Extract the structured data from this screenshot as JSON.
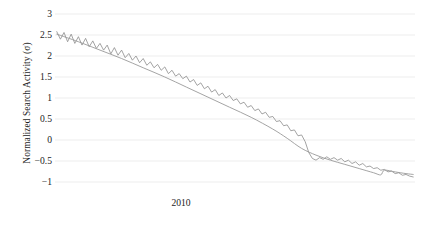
{
  "chart_data": {
    "type": "line",
    "title": "",
    "subtitle": "",
    "xlabel": "",
    "ylabel": "Normalized Search Activity (σ)",
    "ylim": [
      -1,
      3
    ],
    "yticks": [
      3,
      2.5,
      2,
      1.5,
      1,
      0.5,
      0,
      -0.5,
      -1
    ],
    "ytick_labels": [
      "3",
      "2.5",
      "2",
      "1.5",
      "1",
      "0.5",
      "0",
      "−0.5",
      "−1"
    ],
    "xticks": [
      2010
    ],
    "xtick_labels": [
      "2010"
    ],
    "xlim": [
      2008.6,
      2012.6
    ],
    "grid": "horizontal",
    "legend": "none",
    "annotations": [],
    "colors": {
      "noisy_series": "#8c8c8c",
      "smooth_series": "#9a9a9a",
      "gridline": "#e8e8e8",
      "text": "#1d1d1d",
      "background": "#ffffff"
    },
    "series": [
      {
        "name": "Observed normalized search activity",
        "style": "noisy",
        "x": [
          2008.62,
          2008.66,
          2008.7,
          2008.74,
          2008.78,
          2008.82,
          2008.86,
          2008.9,
          2008.94,
          2008.98,
          2009.02,
          2009.06,
          2009.1,
          2009.14,
          2009.18,
          2009.22,
          2009.26,
          2009.3,
          2009.34,
          2009.38,
          2009.42,
          2009.46,
          2009.5,
          2009.54,
          2009.58,
          2009.62,
          2009.66,
          2009.7,
          2009.74,
          2009.78,
          2009.82,
          2009.86,
          2009.9,
          2009.94,
          2009.98,
          2010.02,
          2010.06,
          2010.1,
          2010.14,
          2010.18,
          2010.22,
          2010.26,
          2010.3,
          2010.34,
          2010.38,
          2010.42,
          2010.46,
          2010.5,
          2010.54,
          2010.58,
          2010.62,
          2010.66,
          2010.7,
          2010.74,
          2010.78,
          2010.82,
          2010.86,
          2010.9,
          2010.94,
          2010.98,
          2011.02,
          2011.06,
          2011.1,
          2011.14,
          2011.18,
          2011.22,
          2011.26,
          2011.3,
          2011.34,
          2011.38,
          2011.42,
          2011.46,
          2011.5,
          2011.54,
          2011.58,
          2011.62,
          2011.66,
          2011.7,
          2011.74,
          2011.78,
          2011.82,
          2011.86,
          2011.9,
          2011.94,
          2011.98,
          2012.02,
          2012.06,
          2012.1,
          2012.14,
          2012.18,
          2012.22,
          2012.26,
          2012.3,
          2012.34,
          2012.38,
          2012.42,
          2012.46,
          2012.5,
          2012.54,
          2012.58
        ],
        "y": [
          2.58,
          2.4,
          2.56,
          2.34,
          2.52,
          2.3,
          2.46,
          2.26,
          2.42,
          2.22,
          2.36,
          2.18,
          2.3,
          2.14,
          2.26,
          2.05,
          2.2,
          2.02,
          2.14,
          1.96,
          2.06,
          1.9,
          2.0,
          1.84,
          1.94,
          1.78,
          1.86,
          1.72,
          1.8,
          1.66,
          1.74,
          1.58,
          1.66,
          1.52,
          1.58,
          1.46,
          1.52,
          1.38,
          1.44,
          1.3,
          1.36,
          1.22,
          1.28,
          1.14,
          1.2,
          1.06,
          1.12,
          1.0,
          1.06,
          0.94,
          0.98,
          0.86,
          0.9,
          0.78,
          0.82,
          0.7,
          0.74,
          0.62,
          0.66,
          0.54,
          0.56,
          0.44,
          0.46,
          0.34,
          0.36,
          0.22,
          0.24,
          0.1,
          0.12,
          -0.04,
          -0.3,
          -0.44,
          -0.48,
          -0.42,
          -0.46,
          -0.4,
          -0.46,
          -0.42,
          -0.48,
          -0.44,
          -0.52,
          -0.48,
          -0.56,
          -0.52,
          -0.6,
          -0.56,
          -0.64,
          -0.62,
          -0.68,
          -0.66,
          -0.72,
          -0.7,
          -0.76,
          -0.74,
          -0.8,
          -0.78,
          -0.84,
          -0.82,
          -0.86,
          -0.88
        ]
      },
      {
        "name": "Smoothed trend",
        "style": "smooth",
        "x": [
          2008.62,
          2008.86,
          2009.1,
          2009.34,
          2009.58,
          2009.82,
          2010.06,
          2010.3,
          2010.54,
          2010.78,
          2011.02,
          2011.18,
          2011.34,
          2011.5,
          2011.66,
          2011.82,
          2011.98,
          2012.14,
          2012.22,
          2012.26,
          2012.38,
          2012.5,
          2012.58
        ],
        "y": [
          2.52,
          2.34,
          2.14,
          1.94,
          1.72,
          1.5,
          1.26,
          1.02,
          0.78,
          0.54,
          0.26,
          0.04,
          -0.2,
          -0.36,
          -0.48,
          -0.58,
          -0.68,
          -0.78,
          -0.83,
          -0.72,
          -0.76,
          -0.8,
          -0.82
        ]
      }
    ]
  },
  "axes": {
    "y_title": "Normalized Search Activity (σ)"
  }
}
